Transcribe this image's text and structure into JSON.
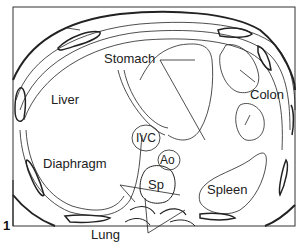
{
  "figure": {
    "number": "1",
    "labels": {
      "stomach": "Stomach",
      "liver": "Liver",
      "colon": "Colon",
      "ivc": "IVC",
      "ao": "Ao",
      "diaphragm": "Diaphragm",
      "sp": "Sp",
      "spleen": "Spleen",
      "lung": "Lung"
    }
  }
}
